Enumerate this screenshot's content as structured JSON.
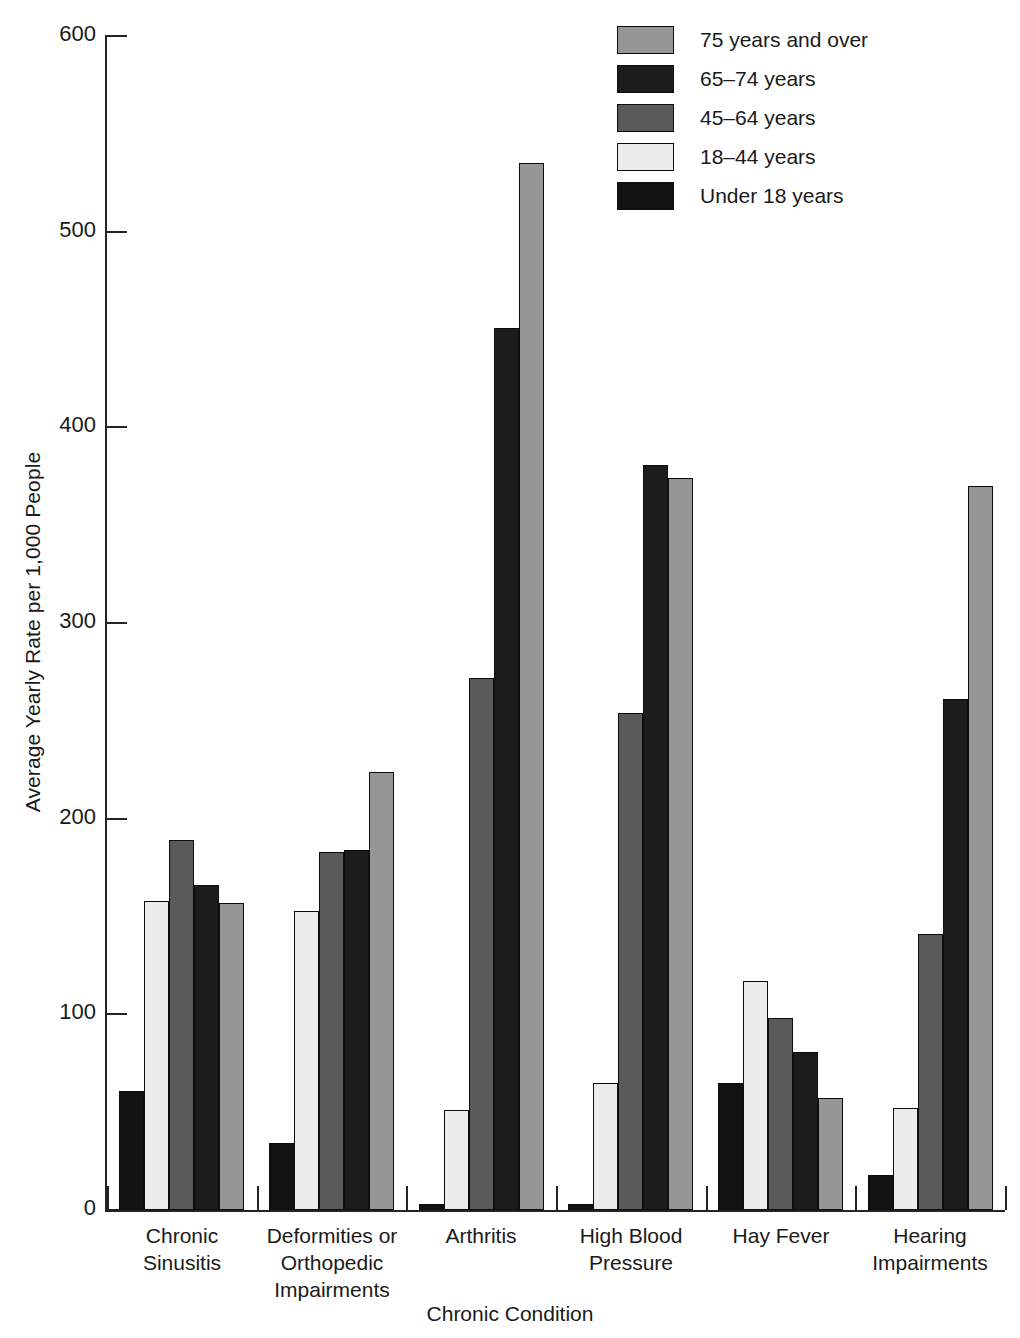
{
  "chart_data": {
    "type": "bar",
    "title": "",
    "xlabel": "Chronic Condition",
    "ylabel": "Average Yearly Rate per 1,000 People",
    "ylim": [
      0,
      600
    ],
    "yticks": [
      0,
      100,
      200,
      300,
      400,
      500,
      600
    ],
    "ytick_labels": [
      "0",
      "100",
      "200",
      "300",
      "400",
      "500",
      "600"
    ],
    "grid": false,
    "legend_position": "top-right",
    "categories": [
      "Chronic Sinusitis",
      "Deformities or Orthopedic Impairments",
      "Arthritis",
      "High Blood Pressure",
      "Hay Fever",
      "Hearing Impairments"
    ],
    "category_lines": [
      [
        "Chronic",
        "Sinusitis"
      ],
      [
        "Deformities or",
        "Orthopedic",
        "Impairments"
      ],
      [
        "Arthritis"
      ],
      [
        "High Blood",
        "Pressure"
      ],
      [
        "Hay Fever"
      ],
      [
        "Hearing",
        "Impairments"
      ]
    ],
    "series": [
      {
        "name": "Under 18 years",
        "color": "#121212",
        "values": [
          61,
          34,
          3,
          3,
          65,
          18
        ]
      },
      {
        "name": "18–44 years",
        "color": "#ececec",
        "values": [
          158,
          153,
          51,
          65,
          117,
          52
        ]
      },
      {
        "name": "45–64 years",
        "color": "#5a5a5a",
        "values": [
          189,
          183,
          272,
          254,
          98,
          141
        ]
      },
      {
        "name": "65–74 years",
        "color": "#1c1c1c",
        "values": [
          166,
          184,
          451,
          381,
          81,
          261
        ]
      },
      {
        "name": "75 years and over",
        "color": "#969696",
        "values": [
          157,
          224,
          535,
          374,
          57,
          370
        ]
      }
    ]
  },
  "legend": {
    "entries": [
      {
        "label": "75 years and over",
        "color": "#969696"
      },
      {
        "label": "65–74 years",
        "color": "#1c1c1c"
      },
      {
        "label": "45–64 years",
        "color": "#5a5a5a"
      },
      {
        "label": "18–44 years",
        "color": "#ececec"
      },
      {
        "label": "Under 18 years",
        "color": "#121212"
      }
    ]
  },
  "axes": {
    "y_title": "Average Yearly Rate per 1,000 People",
    "x_title": "Chronic Condition",
    "y_labels": [
      "600",
      "500",
      "400",
      "300",
      "200",
      "100",
      "0"
    ]
  },
  "colors": {
    "axis": "#242424",
    "bar_outline": "#0d0d0d",
    "background": "#ffffff"
  }
}
